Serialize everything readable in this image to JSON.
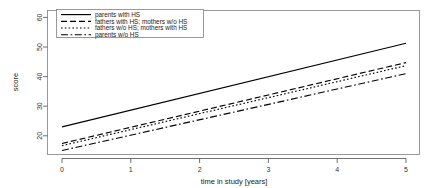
{
  "chart_data": {
    "type": "line",
    "title": "",
    "xlabel": "time in study [years]",
    "ylabel": "score",
    "xlim": [
      0,
      5
    ],
    "ylim": [
      15,
      62
    ],
    "xticks": [
      0,
      1,
      2,
      3,
      4,
      5
    ],
    "xticklabels": [
      "0",
      "1",
      "2",
      "3",
      "4",
      "5"
    ],
    "yticks": [
      20,
      30,
      40,
      50,
      60
    ],
    "yticklabels": [
      "20",
      "30",
      "40",
      "50",
      "60"
    ],
    "grid": false,
    "legend_position": "top-left",
    "x": [
      0,
      5
    ],
    "series": [
      {
        "name": "parents with HS",
        "linestyle": "solid",
        "dasharray": "none",
        "color": "#000000",
        "values": [
          24.0,
          51.3
        ]
      },
      {
        "name": "fathers with HS; mothers w/o HS",
        "linestyle": "dashed",
        "dasharray": "6,3",
        "color": "#000000",
        "values": [
          18.6,
          45.0
        ]
      },
      {
        "name": "fathers w/o HS; mothers with HS",
        "linestyle": "dotted",
        "dasharray": "1.6,2.2",
        "color": "#000000",
        "values": [
          17.9,
          44.0
        ]
      },
      {
        "name": "parents w/o HS",
        "linestyle": "dashdot",
        "dasharray": "7,2.6,1.6,2.6",
        "color": "#000000",
        "values": [
          16.3,
          41.4
        ]
      }
    ]
  }
}
